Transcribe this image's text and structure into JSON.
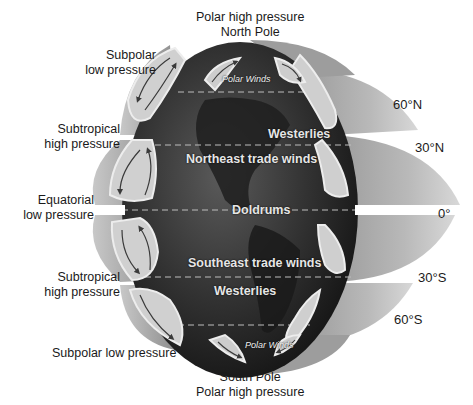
{
  "diagram": {
    "pressure_labels": {
      "north_pole": [
        "Polar high pressure",
        "North Pole"
      ],
      "subpolar_north": [
        "Subpolar",
        "low pressure"
      ],
      "subtropical_north": [
        "Subtropical",
        "high pressure"
      ],
      "equatorial": [
        "Equatorial",
        "low pressure"
      ],
      "subtropical_south": [
        "Subtropical",
        "high pressure"
      ],
      "subpolar_south": "Subpolar low pressure",
      "south_pole": [
        "South Pole",
        "Polar high pressure"
      ]
    },
    "latitude_labels": {
      "lat_60n": "60°N",
      "lat_30n": "30°N",
      "lat_0": "0°",
      "lat_30s": "30°S",
      "lat_60s": "60°S"
    },
    "wind_belts": {
      "polar_north": "Polar Winds",
      "westerlies_north": "Westerlies",
      "ne_trades": "Northeast trade winds",
      "doldrums": "Doldrums",
      "se_trades": "Southeast trade winds",
      "westerlies_south": "Westerlies",
      "polar_south": "Polar Winds"
    },
    "colors": {
      "globe_dark": "#2b2b2b",
      "globe_mid": "#444444",
      "cell_light": "#cfcfcf",
      "cell_mid": "#a9a9a9",
      "cell_outline": "#ececec",
      "arrow": "#3a3a3a",
      "background": "#ffffff"
    }
  }
}
